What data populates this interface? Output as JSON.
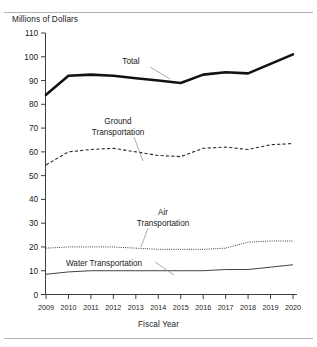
{
  "chart_data": {
    "type": "line",
    "title": "",
    "xlabel": "Fiscal Year",
    "ylabel": "Millions of Dollars",
    "categories": [
      "2009",
      "2010",
      "2011",
      "2012",
      "2013",
      "2014",
      "2015",
      "2016",
      "2017",
      "2018",
      "2019",
      "2020"
    ],
    "ylim": [
      0,
      110
    ],
    "ytick_step": 10,
    "yticks": [
      "0",
      "10",
      "20",
      "30",
      "40",
      "50",
      "60",
      "70",
      "80",
      "90",
      "100",
      "110"
    ],
    "grid": false,
    "legend": "inline-annotations",
    "series": [
      {
        "name": "Total",
        "style": "thick-solid",
        "values": [
          84,
          92,
          92.5,
          92,
          91,
          90,
          89,
          92.5,
          93.5,
          93,
          97,
          101
        ]
      },
      {
        "name": "Ground Transportation",
        "style": "dashed",
        "values": [
          54.5,
          60,
          61,
          61.5,
          60,
          58.5,
          58,
          61.5,
          62,
          61,
          63,
          63.5
        ]
      },
      {
        "name": "Air Transportation",
        "style": "dotted",
        "values": [
          19.5,
          20,
          20,
          20,
          19.5,
          19,
          19,
          19,
          19.5,
          22,
          22.5,
          22.5
        ]
      },
      {
        "name": "Water Transportation",
        "style": "thin-solid",
        "values": [
          8.5,
          9.5,
          10,
          10,
          10,
          10,
          10,
          10,
          10.5,
          10.5,
          11.5,
          12.5
        ]
      }
    ],
    "annotations": [
      {
        "text": "Total",
        "series": "Total"
      },
      {
        "text_line1": "Ground",
        "text_line2": "Transportation",
        "series": "Ground Transportation"
      },
      {
        "text_line1": "Air",
        "text_line2": "Transportation",
        "series": "Air Transportation"
      },
      {
        "text": "Water Transportation",
        "series": "Water Transportation"
      }
    ]
  },
  "axis": {
    "y_title": "Millions of Dollars",
    "x_title": "Fiscal Year"
  },
  "labels": {
    "total": "Total",
    "ground_1": "Ground",
    "ground_2": "Transportation",
    "air_1": "Air",
    "air_2": "Transportation",
    "water": "Water Transportation"
  }
}
